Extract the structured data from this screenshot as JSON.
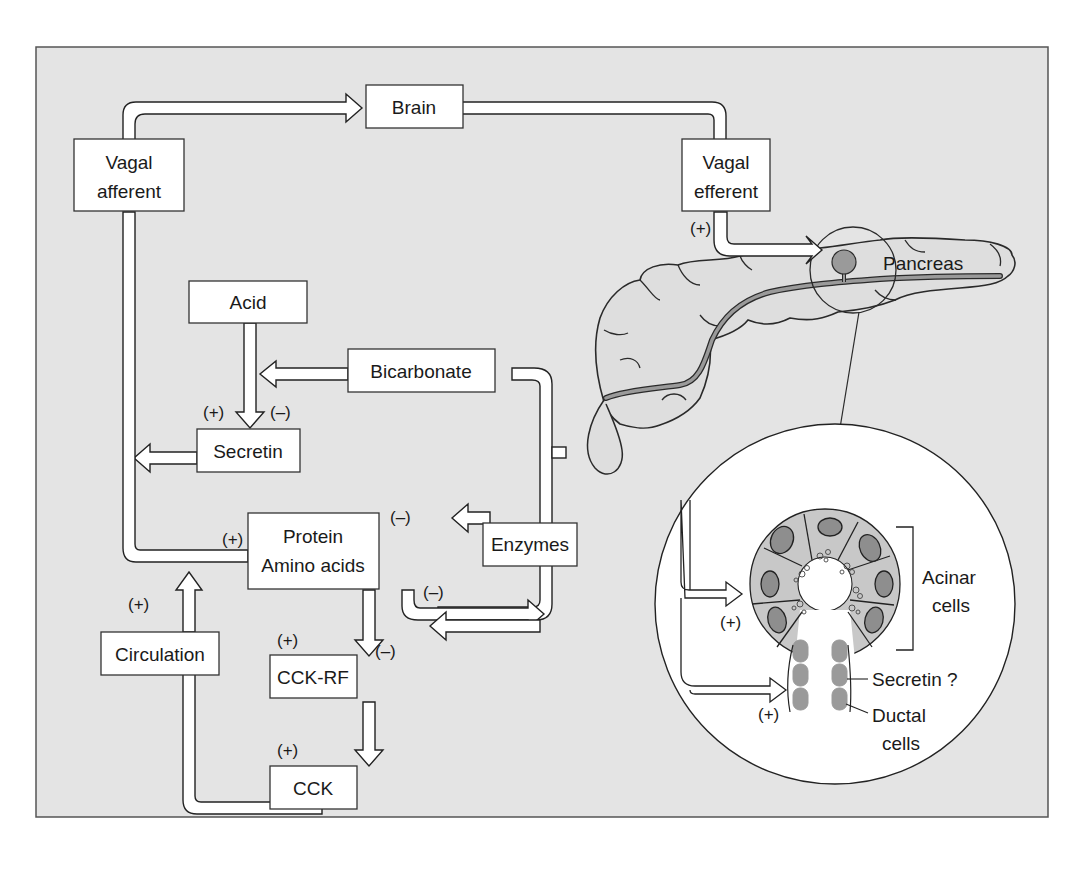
{
  "diagram": {
    "colors": {
      "panel_background": "#e4e4e4",
      "panel_border": "#555555",
      "box_fill": "#ffffff",
      "stroke": "#222222",
      "duct": "#9a9a9a",
      "cell_fill": "#c8c8c8",
      "nucleus_fill": "#8e8e8e",
      "ductal_cell_fill": "#9a9a9a",
      "inset_fill": "#ffffff"
    },
    "nodes": {
      "brain": "Brain",
      "vagal_afferent_line1": "Vagal",
      "vagal_afferent_line2": "afferent",
      "vagal_efferent_line1": "Vagal",
      "vagal_efferent_line2": "efferent",
      "acid": "Acid",
      "bicarbonate": "Bicarbonate",
      "secretin": "Secretin",
      "protein_line1": "Protein",
      "protein_line2": "Amino acids",
      "enzymes": "Enzymes",
      "circulation": "Circulation",
      "cck_rf": "CCK-RF",
      "cck": "CCK"
    },
    "organ_labels": {
      "pancreas": "Pancreas",
      "acinar_line1": "Acinar",
      "acinar_line2": "cells",
      "secretin_q": "Secretin ?",
      "ductal_line1": "Ductal",
      "ductal_line2": "cells"
    },
    "signs": {
      "vagal_efferent_to_pancreas": "(+)",
      "acid_to_secretin": "(+)",
      "bicarbonate_to_secretin": "(–)",
      "protein_to_vagal": "(+)",
      "enzymes_to_protein": "(–)",
      "protein_to_enzymes": "(–)",
      "circulation_up": "(+)",
      "protein_to_cckrf": "(+)",
      "enzymes_to_cckrf": "(–)",
      "cckrf_to_cck": "(+)",
      "inset_acinar": "(+)",
      "inset_ductal": "(+)"
    },
    "edges": [
      {
        "from": "Vagal afferent",
        "to": "Brain",
        "sign": ""
      },
      {
        "from": "Brain",
        "to": "Vagal efferent",
        "sign": ""
      },
      {
        "from": "Vagal efferent",
        "to": "Pancreas",
        "sign": "+"
      },
      {
        "from": "Acid",
        "to": "Secretin",
        "sign": "+"
      },
      {
        "from": "Bicarbonate",
        "to": "Secretin",
        "sign": "-"
      },
      {
        "from": "Secretin",
        "to": "Vagal afferent",
        "sign": ""
      },
      {
        "from": "Protein Amino acids",
        "to": "Vagal afferent",
        "sign": "+"
      },
      {
        "from": "Enzymes",
        "to": "Protein Amino acids",
        "sign": "-"
      },
      {
        "from": "Protein Amino acids",
        "to": "Enzymes",
        "sign": "-"
      },
      {
        "from": "Protein Amino acids",
        "to": "CCK-RF",
        "sign": "+"
      },
      {
        "from": "Enzymes",
        "to": "CCK-RF",
        "sign": "-"
      },
      {
        "from": "CCK-RF",
        "to": "CCK",
        "sign": "+"
      },
      {
        "from": "CCK",
        "to": "Circulation",
        "sign": ""
      },
      {
        "from": "Circulation",
        "to": "Vagal afferent",
        "sign": "+"
      },
      {
        "from": "Pancreas",
        "to": "Bicarbonate/Enzymes",
        "sign": ""
      },
      {
        "from": "Stimulus",
        "to": "Acinar cells",
        "sign": "+"
      },
      {
        "from": "Stimulus",
        "to": "Ductal cells",
        "sign": "+"
      }
    ]
  }
}
